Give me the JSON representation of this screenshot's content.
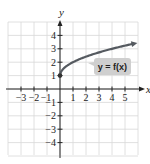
{
  "chart_data": {
    "type": "line",
    "title": "",
    "xlabel": "x",
    "ylabel": "y",
    "xlim": [
      -4,
      6
    ],
    "ylim": [
      -5,
      5
    ],
    "grid": true,
    "x_ticks": [
      -3,
      -2,
      -1,
      1,
      2,
      3,
      4,
      5
    ],
    "y_ticks": [
      -4,
      -3,
      -2,
      -1,
      1,
      2,
      3,
      4
    ],
    "x_tick_labels": [
      "−3",
      "−2",
      "−1",
      "1",
      "2",
      "3",
      "4",
      "5"
    ],
    "y_tick_labels": [
      "−4",
      "−3",
      "−2",
      "−1",
      "1",
      "2",
      "3",
      "4"
    ],
    "series": [
      {
        "name": "y = f(x)",
        "function": "sqrt(x) + 1",
        "start_point": {
          "x": 0,
          "y": 1,
          "marker": "filled-dot"
        },
        "end_arrow": true,
        "x": [
          0,
          0.25,
          0.5,
          1,
          2,
          3,
          4,
          5,
          5.8
        ],
        "y": [
          1,
          1.5,
          1.71,
          2,
          2.41,
          2.73,
          3,
          3.24,
          3.41
        ],
        "color": "#555a60"
      }
    ],
    "annotations": [
      {
        "text": "y = f(x)",
        "x": 3.3,
        "y": 1.8,
        "style": "grey-callout-box"
      }
    ]
  },
  "colors": {
    "grid": "#d8d8d8",
    "axis": "#222222",
    "curve": "#555a60",
    "callout_bg": "#cfcfcf"
  }
}
